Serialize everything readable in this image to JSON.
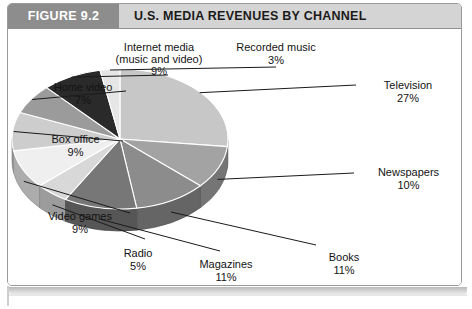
{
  "figure": {
    "tag": "FIGURE 9.2",
    "title": "U.S. MEDIA REVENUES BY CHANNEL"
  },
  "colors": {
    "tag_bg": "#8d8d8d",
    "header_bg": "#d4d4d4",
    "frame_border": "#9a9a9a",
    "text": "#131313"
  },
  "chart_data": {
    "type": "pie",
    "title": "U.S. MEDIA REVENUES BY CHANNEL",
    "xlabel": "",
    "ylabel": "",
    "unit": "%",
    "legend": "none",
    "grid": false,
    "three_d": true,
    "start_angle_deg": 0,
    "direction": "clockwise",
    "categories": [
      "Television",
      "Newspapers",
      "Books",
      "Magazines",
      "Radio",
      "Video games",
      "Box office",
      "Home video",
      "Internet media (music and video)",
      "Recorded music"
    ],
    "values": [
      27,
      10,
      11,
      11,
      5,
      9,
      9,
      7,
      9,
      3
    ],
    "slice_colors": [
      "#c7c7c7",
      "#a3a3a3",
      "#8c8c8c",
      "#777777",
      "#d8d8d8",
      "#efefef",
      "#cdcdcd",
      "#9b9b9b",
      "#2a2a2a",
      "#e6e6e6"
    ],
    "slices": [
      {
        "label": "Television",
        "name_line1": "Television",
        "name_line2": "",
        "pct": "27%",
        "value": 27
      },
      {
        "label": "Newspapers",
        "name_line1": "Newspapers",
        "name_line2": "",
        "pct": "10%",
        "value": 10
      },
      {
        "label": "Books",
        "name_line1": "Books",
        "name_line2": "",
        "pct": "11%",
        "value": 11
      },
      {
        "label": "Magazines",
        "name_line1": "Magazines",
        "name_line2": "",
        "pct": "11%",
        "value": 11
      },
      {
        "label": "Radio",
        "name_line1": "Radio",
        "name_line2": "",
        "pct": "5%",
        "value": 5
      },
      {
        "label": "Video games",
        "name_line1": "Video games",
        "name_line2": "",
        "pct": "9%",
        "value": 9
      },
      {
        "label": "Box office",
        "name_line1": "Box office",
        "name_line2": "",
        "pct": "9%",
        "value": 9
      },
      {
        "label": "Home video",
        "name_line1": "Home video",
        "name_line2": "",
        "pct": "7%",
        "value": 7
      },
      {
        "label": "Internet media (music and video)",
        "name_line1": "Internet media",
        "name_line2": "(music and video)",
        "pct": "9%",
        "value": 9
      },
      {
        "label": "Recorded music",
        "name_line1": "Recorded music",
        "name_line2": "",
        "pct": "3%",
        "value": 3
      }
    ]
  }
}
